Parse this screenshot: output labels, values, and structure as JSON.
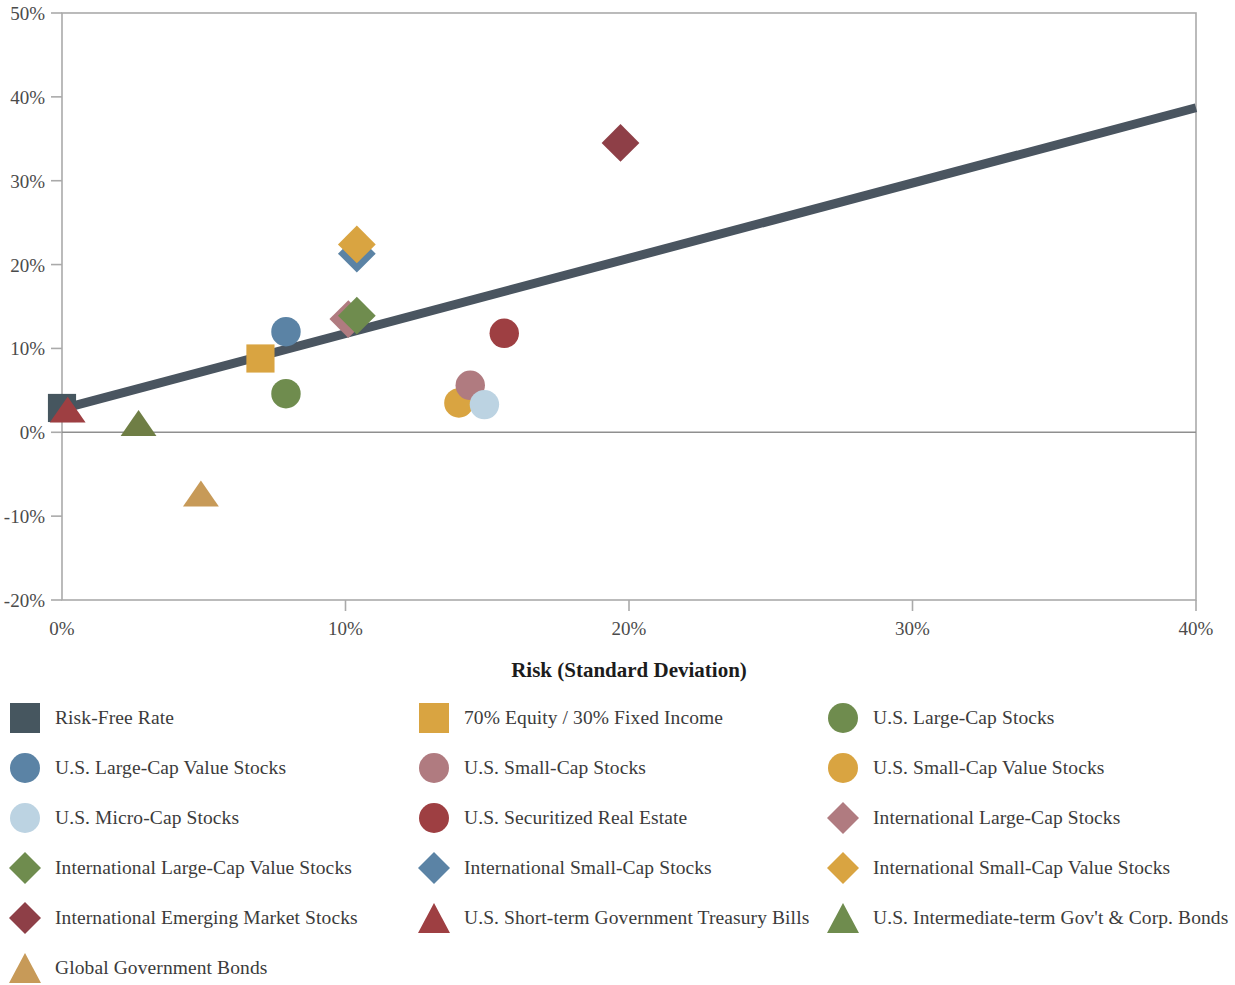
{
  "chart_data": {
    "type": "scatter",
    "title": "",
    "xlabel": "Risk (Standard Deviation)",
    "ylabel": "",
    "xlim": [
      0,
      40
    ],
    "ylim": [
      -20,
      50
    ],
    "x_ticks": [
      "0%",
      "10%",
      "20%",
      "30%",
      "40%"
    ],
    "x_tick_values": [
      0,
      10,
      20,
      30,
      40
    ],
    "y_ticks": [
      "50%",
      "40%",
      "30%",
      "20%",
      "10%",
      "0%",
      "-10%",
      "-20%"
    ],
    "y_tick_values": [
      50,
      40,
      30,
      20,
      10,
      0,
      -10,
      -20
    ],
    "grid": false,
    "zero_line": true,
    "legend_position": "bottom",
    "trendline": {
      "name": "Capital Market Line",
      "x": [
        0,
        40
      ],
      "y": [
        2.8,
        38.7
      ],
      "color": "#4a5560",
      "width": 9
    },
    "points": [
      {
        "label": "Risk-Free Rate",
        "x": 0.0,
        "y": 2.9,
        "shape": "square",
        "color": "#46565f"
      },
      {
        "label": "U.S. Short-term Government Treasury Bills",
        "x": 0.2,
        "y": 2.7,
        "shape": "triangle",
        "color": "#9e3f42"
      },
      {
        "label": "U.S. Intermediate-term Gov't & Corp. Bonds",
        "x": 2.7,
        "y": 1.1,
        "shape": "triangle",
        "color": "#6f7e45"
      },
      {
        "label": "Global Government Bonds",
        "x": 4.9,
        "y": -7.3,
        "shape": "triangle",
        "color": "#c79a58"
      },
      {
        "label": "70% Equity / 30% Fixed Income",
        "x": 7.0,
        "y": 8.8,
        "shape": "square",
        "color": "#d9a441"
      },
      {
        "label": "U.S. Large-Cap Value Stocks",
        "x": 7.9,
        "y": 12.0,
        "shape": "circle",
        "color": "#5b83a5"
      },
      {
        "label": "U.S. Large-Cap Stocks",
        "x": 7.9,
        "y": 4.6,
        "shape": "circle",
        "color": "#6f8c4e"
      },
      {
        "label": "International Large-Cap Stocks",
        "x": 10.1,
        "y": 13.5,
        "shape": "diamond",
        "color": "#b07b80"
      },
      {
        "label": "International Large-Cap Value Stocks",
        "x": 10.4,
        "y": 13.9,
        "shape": "diamond",
        "color": "#6f8c4e"
      },
      {
        "label": "International Small-Cap Stocks",
        "x": 10.4,
        "y": 21.3,
        "shape": "diamond",
        "color": "#5b83a5"
      },
      {
        "label": "International Small-Cap Value Stocks",
        "x": 10.4,
        "y": 22.4,
        "shape": "diamond",
        "color": "#d9a441"
      },
      {
        "label": "U.S. Small-Cap Value Stocks",
        "x": 14.0,
        "y": 3.5,
        "shape": "circle",
        "color": "#d9a441"
      },
      {
        "label": "U.S. Small-Cap Stocks",
        "x": 14.4,
        "y": 5.6,
        "shape": "circle",
        "color": "#b07b80"
      },
      {
        "label": "U.S. Micro-Cap Stocks",
        "x": 14.9,
        "y": 3.3,
        "shape": "circle",
        "color": "#bcd3e2"
      },
      {
        "label": "U.S. Securitized Real Estate",
        "x": 15.6,
        "y": 11.8,
        "shape": "circle",
        "color": "#9e3f42"
      },
      {
        "label": "International Emerging Market Stocks",
        "x": 19.7,
        "y": 34.5,
        "shape": "diamond",
        "color": "#8e3f47"
      }
    ]
  },
  "axis": {
    "x_title": "Risk (Standard Deviation)"
  },
  "legend": {
    "items": [
      {
        "label": "Risk-Free Rate",
        "shape": "square",
        "color": "#46565f"
      },
      {
        "label": "70% Equity / 30% Fixed Income",
        "shape": "square",
        "color": "#d9a441"
      },
      {
        "label": "U.S. Large-Cap Stocks",
        "shape": "circle",
        "color": "#6f8c4e"
      },
      {
        "label": "U.S. Large-Cap Value Stocks",
        "shape": "circle",
        "color": "#5b83a5"
      },
      {
        "label": "U.S. Small-Cap Stocks",
        "shape": "circle",
        "color": "#b07b80"
      },
      {
        "label": "U.S. Small-Cap Value Stocks",
        "shape": "circle",
        "color": "#d9a441"
      },
      {
        "label": "U.S. Micro-Cap Stocks",
        "shape": "circle",
        "color": "#bcd3e2"
      },
      {
        "label": "U.S. Securitized Real Estate",
        "shape": "circle",
        "color": "#9e3f42"
      },
      {
        "label": "International Large-Cap Stocks",
        "shape": "diamond",
        "color": "#b07b80"
      },
      {
        "label": "International Large-Cap Value Stocks",
        "shape": "diamond",
        "color": "#6f8c4e"
      },
      {
        "label": "International Small-Cap Stocks",
        "shape": "diamond",
        "color": "#5b83a5"
      },
      {
        "label": "International Small-Cap Value Stocks",
        "shape": "diamond",
        "color": "#d9a441"
      },
      {
        "label": "International Emerging Market Stocks",
        "shape": "diamond",
        "color": "#8e3f47"
      },
      {
        "label": "U.S. Short-term Government Treasury Bills",
        "shape": "triangle",
        "color": "#9e3f42"
      },
      {
        "label": "U.S. Intermediate-term Gov't & Corp. Bonds",
        "shape": "triangle",
        "color": "#6f8c4e"
      },
      {
        "label": "Global Government Bonds",
        "shape": "triangle",
        "color": "#c79a58"
      }
    ]
  },
  "colors": {
    "axis_line": "#aaaaaa",
    "zero_line": "#8f8f8f",
    "trendline": "#4a5560",
    "text": "#3b3b3b"
  }
}
